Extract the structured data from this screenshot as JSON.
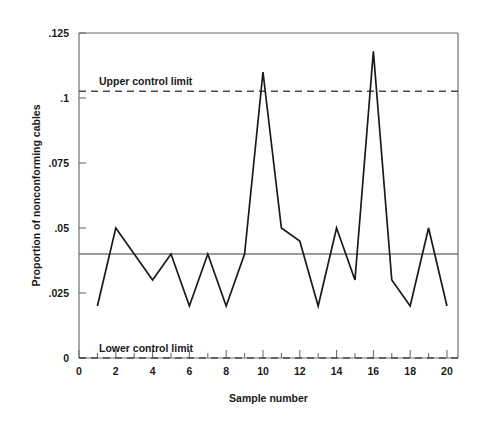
{
  "chart_data": {
    "type": "line",
    "title": "",
    "xlabel": "Sample number",
    "ylabel": "Proportion of nonconforming cables",
    "xlim": [
      0,
      20.6
    ],
    "ylim": [
      0,
      0.125
    ],
    "grid": false,
    "legend": "none",
    "x": [
      1,
      2,
      3,
      4,
      5,
      6,
      7,
      8,
      9,
      10,
      11,
      12,
      13,
      14,
      15,
      16,
      17,
      18,
      19,
      20
    ],
    "values": [
      0.02,
      0.05,
      0.04,
      0.03,
      0.04,
      0.02,
      0.04,
      0.02,
      0.04,
      0.11,
      0.05,
      0.045,
      0.02,
      0.05,
      0.03,
      0.118,
      0.03,
      0.02,
      0.05,
      0.02
    ],
    "series": [
      {
        "name": "Proportion of nonconforming cables",
        "values": [
          0.02,
          0.05,
          0.04,
          0.03,
          0.04,
          0.02,
          0.04,
          0.02,
          0.04,
          0.11,
          0.05,
          0.045,
          0.02,
          0.05,
          0.03,
          0.118,
          0.03,
          0.02,
          0.05,
          0.02
        ]
      }
    ],
    "xticks": [
      0,
      2,
      4,
      6,
      8,
      10,
      12,
      14,
      16,
      18,
      20
    ],
    "xtick_labels": [
      "0",
      "2",
      "4",
      "6",
      "8",
      "10",
      "12",
      "14",
      "16",
      "18",
      "20"
    ],
    "xticks_minor": [
      1,
      3,
      5,
      7,
      9,
      11,
      13,
      15,
      17,
      19
    ],
    "yticks": [
      0,
      0.025,
      0.05,
      0.075,
      0.1,
      0.125
    ],
    "ytick_labels": [
      "0",
      ".025",
      ".05",
      ".075",
      ".1",
      ".125"
    ],
    "reference_lines": [
      {
        "name": "upper-control-limit",
        "label": "Upper control limit",
        "value": 0.1026,
        "style": "dashed"
      },
      {
        "name": "center-line",
        "label": "",
        "value": 0.04,
        "style": "solid"
      },
      {
        "name": "lower-control-limit",
        "label": "Lower control limit",
        "value": 0.0,
        "style": "dashed"
      }
    ],
    "colors": {
      "series": "#1a1a1a",
      "axis": "#6e6e6e",
      "center_line": "#7a7a7a",
      "limit_line": "#4a4a4a",
      "background": "#ffffff"
    }
  }
}
